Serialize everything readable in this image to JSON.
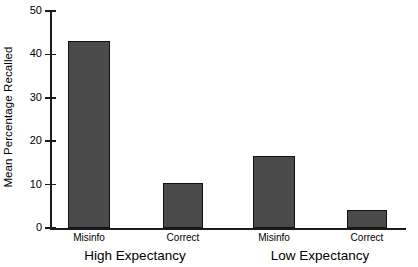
{
  "chart_data": {
    "type": "bar",
    "title": "",
    "xlabel": "",
    "ylabel": "Mean Percentage Recalled",
    "ylim": [
      0,
      50
    ],
    "yticks": [
      0,
      10,
      20,
      30,
      40,
      50
    ],
    "ytick_labels": [
      "0",
      "10",
      "20",
      "30",
      "40",
      "50"
    ],
    "grid": false,
    "legend": null,
    "categories": [
      "Misinfo",
      "Correct",
      "Misinfo",
      "Correct"
    ],
    "values": [
      43,
      10.4,
      16.6,
      4.1
    ],
    "groups": [
      {
        "label": "High Expectancy",
        "categories": [
          "Misinfo",
          "Correct"
        ],
        "values": [
          43,
          10.4
        ]
      },
      {
        "label": "Low Expectancy",
        "categories": [
          "Misinfo",
          "Correct"
        ],
        "values": [
          16.6,
          4.1
        ]
      }
    ],
    "bar_color": "#4b4b4b",
    "bar_edge_color": "#111111",
    "axis_color": "#1a1a1a",
    "background": "#ffffff"
  },
  "bars": [
    {
      "label": "Misinfo",
      "value": 43,
      "left": 68,
      "width": 42
    },
    {
      "label": "Correct",
      "value": 10.4,
      "left": 163,
      "width": 40
    },
    {
      "label": "Misinfo",
      "value": 16.6,
      "left": 253,
      "width": 42
    },
    {
      "label": "Correct",
      "value": 4.1,
      "left": 347,
      "width": 40
    }
  ],
  "group_labels": [
    {
      "text": "High Expectancy",
      "center": 135
    },
    {
      "text": "Low Expectancy",
      "center": 320
    }
  ]
}
